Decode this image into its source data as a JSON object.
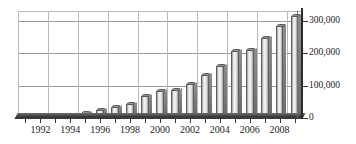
{
  "chart_data": {
    "type": "bar",
    "title": "",
    "subtitle": "",
    "xlabel": "",
    "ylabel": "",
    "grid": true,
    "legend": "none",
    "y_axis_position": "right",
    "ylim": [
      0,
      330000
    ],
    "yticks": [
      0,
      100000,
      200000,
      300000
    ],
    "ytick_labels": [
      "0",
      "100,000",
      "200,000",
      "300,000"
    ],
    "categories": [
      "1991",
      "1992",
      "1993",
      "1994",
      "1995",
      "1996",
      "1997",
      "1998",
      "1999",
      "2000",
      "2001",
      "2002",
      "2003",
      "2004",
      "2005",
      "2006",
      "2007",
      "2008",
      "2009"
    ],
    "xtick_labels_shown": [
      "1992",
      "1994",
      "1996",
      "1998",
      "2000",
      "2002",
      "2004",
      "2006",
      "2008"
    ],
    "values": [
      2000,
      3000,
      4000,
      6000,
      14000,
      26000,
      34000,
      43000,
      68000,
      83000,
      86000,
      105000,
      133000,
      160000,
      207000,
      209000,
      248000,
      283000,
      315000
    ]
  }
}
